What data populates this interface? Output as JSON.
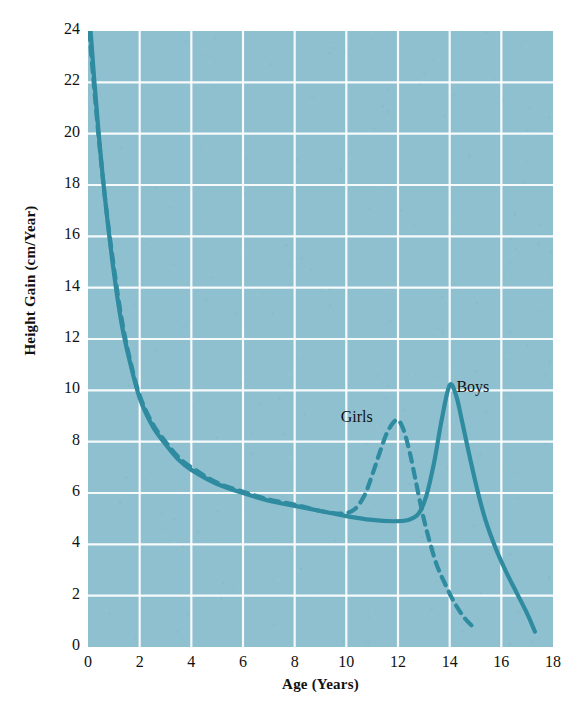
{
  "chart_data": {
    "type": "line",
    "title": "",
    "xlabel": "Age (Years)",
    "ylabel": "Height Gain (cm/Year)",
    "xlim": [
      0,
      18
    ],
    "ylim": [
      0,
      24
    ],
    "xticks": [
      "0",
      "2",
      "4",
      "6",
      "8",
      "10",
      "12",
      "14",
      "16",
      "18"
    ],
    "yticks": [
      "0",
      "2",
      "4",
      "6",
      "8",
      "10",
      "12",
      "14",
      "16",
      "18",
      "20",
      "22",
      "24"
    ],
    "grid": true,
    "legend_position": "inline-annotations",
    "plot_background": "#8fc0d0",
    "grid_color": "#ffffff",
    "series": [
      {
        "name": "Boys",
        "style": "solid",
        "color": "#2f8ba0",
        "label_x": 14.9,
        "label_y": 10.1,
        "points": [
          [
            0.1,
            24.0
          ],
          [
            0.25,
            22.0
          ],
          [
            0.45,
            19.6
          ],
          [
            0.7,
            17.1
          ],
          [
            1.0,
            14.6
          ],
          [
            1.3,
            12.6
          ],
          [
            1.6,
            11.2
          ],
          [
            2.0,
            9.7
          ],
          [
            2.5,
            8.6
          ],
          [
            3.0,
            7.9
          ],
          [
            3.5,
            7.3
          ],
          [
            4.0,
            6.9
          ],
          [
            5.0,
            6.35
          ],
          [
            6.0,
            6.0
          ],
          [
            7.0,
            5.7
          ],
          [
            8.0,
            5.5
          ],
          [
            9.0,
            5.3
          ],
          [
            10.0,
            5.1
          ],
          [
            11.0,
            4.95
          ],
          [
            11.8,
            4.9
          ],
          [
            12.4,
            4.95
          ],
          [
            12.8,
            5.2
          ],
          [
            13.1,
            5.9
          ],
          [
            13.4,
            7.2
          ],
          [
            13.7,
            8.9
          ],
          [
            14.0,
            10.2
          ],
          [
            14.25,
            9.8
          ],
          [
            14.5,
            8.7
          ],
          [
            14.8,
            7.3
          ],
          [
            15.1,
            6.0
          ],
          [
            15.4,
            4.9
          ],
          [
            15.8,
            3.8
          ],
          [
            16.2,
            2.9
          ],
          [
            16.6,
            2.1
          ],
          [
            17.0,
            1.3
          ],
          [
            17.3,
            0.6
          ]
        ]
      },
      {
        "name": "Girls",
        "style": "dashed",
        "color": "#2f8ba0",
        "label_x": 10.4,
        "label_y": 8.85,
        "points": [
          [
            0.05,
            24.0
          ],
          [
            0.22,
            22.0
          ],
          [
            0.42,
            19.8
          ],
          [
            0.68,
            17.3
          ],
          [
            1.0,
            14.8
          ],
          [
            1.3,
            12.8
          ],
          [
            1.6,
            11.3
          ],
          [
            2.0,
            9.8
          ],
          [
            2.5,
            8.7
          ],
          [
            3.0,
            8.0
          ],
          [
            3.5,
            7.4
          ],
          [
            4.0,
            7.0
          ],
          [
            5.0,
            6.4
          ],
          [
            6.0,
            6.05
          ],
          [
            7.0,
            5.75
          ],
          [
            8.0,
            5.55
          ],
          [
            9.0,
            5.3
          ],
          [
            9.8,
            5.2
          ],
          [
            10.3,
            5.35
          ],
          [
            10.7,
            5.9
          ],
          [
            11.0,
            6.7
          ],
          [
            11.3,
            7.6
          ],
          [
            11.6,
            8.4
          ],
          [
            11.95,
            8.85
          ],
          [
            12.2,
            8.5
          ],
          [
            12.45,
            7.6
          ],
          [
            12.7,
            6.4
          ],
          [
            12.95,
            5.2
          ],
          [
            13.2,
            4.2
          ],
          [
            13.5,
            3.2
          ],
          [
            13.85,
            2.4
          ],
          [
            14.2,
            1.7
          ],
          [
            14.6,
            1.1
          ],
          [
            15.0,
            0.7
          ]
        ]
      }
    ]
  },
  "caption": ""
}
